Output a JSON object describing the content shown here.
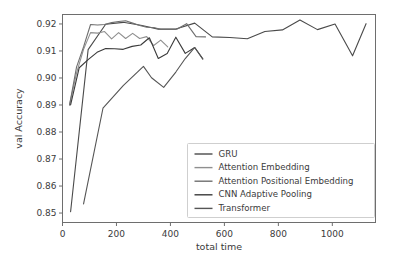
{
  "chart_data": {
    "type": "line",
    "title": "",
    "xlabel": "total time",
    "ylabel": "val Accuracy",
    "xlim": [
      0,
      1160
    ],
    "ylim": [
      0.8465,
      0.9235
    ],
    "grid": false,
    "legend_position": "lower right",
    "xticks": [
      0,
      200,
      400,
      600,
      800,
      1000
    ],
    "xtick_labels": [
      "0",
      "200",
      "400",
      "600",
      "800",
      "1000"
    ],
    "yticks": [
      0.85,
      0.86,
      0.87,
      0.88,
      0.89,
      0.9,
      0.91,
      0.92
    ],
    "ytick_labels": [
      "0.85",
      "0.86",
      "0.87",
      "0.88",
      "0.89",
      "0.90",
      "0.91",
      "0.92"
    ],
    "series": [
      {
        "name": "GRU",
        "color": "#4a4a4a",
        "x": [
          30,
          95,
          160,
          225,
          290,
          355,
          420,
          490,
          555,
          620,
          685,
          750,
          815,
          880,
          945,
          1010,
          1075,
          1125
        ],
        "y": [
          0.8505,
          0.9105,
          0.9199,
          0.9206,
          0.9195,
          0.9181,
          0.9181,
          0.9203,
          0.9152,
          0.915,
          0.9145,
          0.9172,
          0.9178,
          0.9215,
          0.9179,
          0.92,
          0.9082,
          0.9201
        ]
      },
      {
        "name": "Attention Embedding",
        "color": "#8f8f8f",
        "x": [
          26,
          52,
          78,
          104,
          130,
          156,
          182,
          208,
          234,
          260,
          286,
          312,
          338,
          364,
          390
        ],
        "y": [
          0.89,
          0.9018,
          0.9106,
          0.9168,
          0.9166,
          0.9172,
          0.9145,
          0.9168,
          0.9146,
          0.9165,
          0.9146,
          0.9153,
          0.912,
          0.914,
          0.9115
        ]
      },
      {
        "name": "Attention Positional Embedding",
        "color": "#6f6f6f",
        "x": [
          26,
          52,
          78,
          104,
          130,
          156,
          182,
          208,
          234,
          260,
          286,
          312,
          338,
          364,
          390,
          425,
          460,
          495,
          530
        ],
        "y": [
          0.89,
          0.904,
          0.9115,
          0.9198,
          0.9196,
          0.9198,
          0.9205,
          0.9209,
          0.9212,
          0.9203,
          0.9194,
          0.9188,
          0.9187,
          0.918,
          0.918,
          0.9181,
          0.9201,
          0.9153,
          0.9152
        ]
      },
      {
        "name": "CNN Adaptive Pooling",
        "color": "#3a3a3a",
        "x": [
          30,
          62,
          95,
          128,
          160,
          193,
          225,
          258,
          290,
          322,
          355,
          388,
          420,
          455,
          490,
          520
        ],
        "y": [
          0.89,
          0.9038,
          0.9068,
          0.9095,
          0.9109,
          0.9108,
          0.9106,
          0.9117,
          0.9122,
          0.9149,
          0.9072,
          0.9091,
          0.9151,
          0.9091,
          0.9113,
          0.9071
        ]
      },
      {
        "name": "Transformer",
        "color": "#555555",
        "x": [
          78,
          150,
          225,
          300,
          330,
          375,
          420,
          455,
          490,
          520
        ],
        "y": [
          0.8534,
          0.8888,
          0.8972,
          0.9043,
          0.9001,
          0.8965,
          0.9022,
          0.9072,
          0.9113,
          0.907
        ]
      }
    ]
  },
  "legend": {
    "entries": [
      {
        "label": "GRU"
      },
      {
        "label": "Attention Embedding"
      },
      {
        "label": "Attention Positional Embedding"
      },
      {
        "label": "CNN Adaptive Pooling"
      },
      {
        "label": "Transformer"
      }
    ]
  }
}
